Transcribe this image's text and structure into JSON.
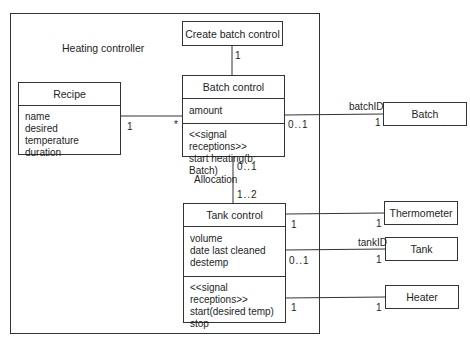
{
  "diagram": {
    "frame_title": "Heating controller",
    "classes": {
      "create_batch_control": {
        "name": "Create batch control"
      },
      "batch_control": {
        "name": "Batch control",
        "attributes": [
          "amount"
        ],
        "operations": [
          "<<signal receptions>>",
          "start heating(b: Batch)"
        ]
      },
      "recipe": {
        "name": "Recipe",
        "attributes": [
          "name",
          "desired temperature",
          "duration"
        ]
      },
      "tank_control": {
        "name": "Tank control",
        "attributes": [
          "volume",
          "date last cleaned",
          "destemp"
        ],
        "operations": [
          "<<signal receptions>>",
          "start(desired temp)",
          "stop"
        ]
      },
      "batch": {
        "name": "Batch"
      },
      "thermometer": {
        "name": "Thermometer"
      },
      "tank": {
        "name": "Tank"
      },
      "heater": {
        "name": "Heater"
      }
    },
    "associations": {
      "create_to_batch": {
        "mult_batch_end": "1"
      },
      "recipe_to_batch": {
        "mult_recipe_end": "1",
        "mult_batch_end": "*"
      },
      "batch_to_batch": {
        "mult_control_end": "0..1",
        "qualifier": "batchID",
        "mult_batch_end": "1"
      },
      "allocation": {
        "name": "Allocation",
        "mult_batch_end": "0..1",
        "mult_tank_end": "1..2"
      },
      "tank_to_thermometer": {
        "mult_tank_end": "1",
        "mult_thermometer_end": "1"
      },
      "tank_to_tank": {
        "mult_tank_end": "0..1",
        "qualifier": "tankID",
        "mult_tank_class_end": "1"
      },
      "tank_to_heater": {
        "mult_tank_end": "1",
        "mult_heater_end": "1"
      }
    },
    "colors": {
      "line": "#333333",
      "text": "#1e1e1e",
      "background": "#ffffff"
    }
  }
}
